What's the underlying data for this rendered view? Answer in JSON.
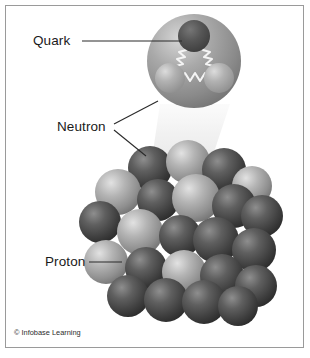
{
  "figure": {
    "background_color": "#ffffff",
    "border_color": "#9a9a9a",
    "credit": "© Infobase Learning"
  },
  "labels": [
    {
      "id": "quark",
      "text": "Quark",
      "leader": "horizontal line from label to the dark quark inside the magnified nucleon"
    },
    {
      "id": "neutron",
      "text": "Neutron",
      "leader": "two angled lines, one to the magnified nucleon, one to a dark sphere in the nucleus"
    },
    {
      "id": "proton",
      "text": "Proton",
      "leader": "horizontal line from label to a light sphere in the nucleus"
    }
  ],
  "magnified_nucleon": {
    "name": "neutron",
    "center": {
      "x": 194,
      "y": 61
    },
    "radius": 47,
    "body_color": "#8c8c8c",
    "highlight_color": "#d3d3d3",
    "quarks": [
      {
        "id": "quark-top",
        "cx": 194,
        "cy": 36,
        "r": 16,
        "color": "#4f4f4f",
        "highlight": "#6e6e6e"
      },
      {
        "id": "quark-bottom-left",
        "cx": 170,
        "cy": 78,
        "r": 15,
        "color": "#a8a8a8",
        "highlight": "#d8d8d8"
      },
      {
        "id": "quark-bottom-right",
        "cx": 219,
        "cy": 78,
        "r": 15,
        "color": "#a0a0a0",
        "highlight": "#cfcfcf"
      }
    ],
    "gluon_color": "#f2f2f2",
    "gluon_count": 3
  },
  "magnification_beam": {
    "color": "#ececec",
    "description": "faint cone widening from the nucleus up to the magnified nucleon"
  },
  "nucleus": {
    "proton_color": "#9e9e9e",
    "proton_highlight": "#d8d8d8",
    "neutron_color": "#4a4a4a",
    "neutron_highlight": "#7d7d7d",
    "spheres": [
      {
        "cx": 150,
        "cy": 168,
        "r": 22,
        "type": "neutron"
      },
      {
        "cx": 188,
        "cy": 162,
        "r": 22,
        "type": "proton"
      },
      {
        "cx": 224,
        "cy": 170,
        "r": 22,
        "type": "neutron"
      },
      {
        "cx": 252,
        "cy": 186,
        "r": 20,
        "type": "proton"
      },
      {
        "cx": 118,
        "cy": 192,
        "r": 23,
        "type": "proton"
      },
      {
        "cx": 158,
        "cy": 200,
        "r": 21,
        "type": "neutron"
      },
      {
        "cx": 196,
        "cy": 198,
        "r": 24,
        "type": "proton"
      },
      {
        "cx": 234,
        "cy": 206,
        "r": 22,
        "type": "neutron"
      },
      {
        "cx": 262,
        "cy": 216,
        "r": 21,
        "type": "neutron"
      },
      {
        "cx": 100,
        "cy": 222,
        "r": 21,
        "type": "neutron"
      },
      {
        "cx": 140,
        "cy": 232,
        "r": 23,
        "type": "proton"
      },
      {
        "cx": 180,
        "cy": 236,
        "r": 21,
        "type": "neutron"
      },
      {
        "cx": 216,
        "cy": 240,
        "r": 23,
        "type": "neutron"
      },
      {
        "cx": 254,
        "cy": 250,
        "r": 22,
        "type": "neutron"
      },
      {
        "cx": 106,
        "cy": 262,
        "r": 22,
        "type": "proton"
      },
      {
        "cx": 146,
        "cy": 268,
        "r": 21,
        "type": "neutron"
      },
      {
        "cx": 184,
        "cy": 272,
        "r": 22,
        "type": "proton"
      },
      {
        "cx": 222,
        "cy": 276,
        "r": 22,
        "type": "neutron"
      },
      {
        "cx": 256,
        "cy": 286,
        "r": 21,
        "type": "neutron"
      },
      {
        "cx": 128,
        "cy": 296,
        "r": 21,
        "type": "neutron"
      },
      {
        "cx": 166,
        "cy": 300,
        "r": 22,
        "type": "neutron"
      },
      {
        "cx": 204,
        "cy": 302,
        "r": 22,
        "type": "neutron"
      },
      {
        "cx": 238,
        "cy": 306,
        "r": 20,
        "type": "neutron"
      }
    ]
  }
}
